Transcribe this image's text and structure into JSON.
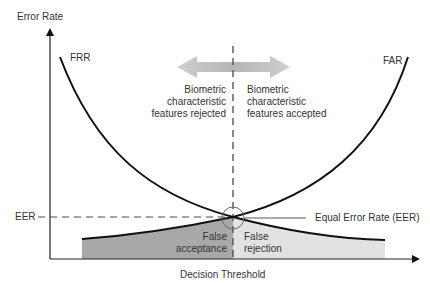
{
  "diagram": {
    "y_axis_label": "Error Rate",
    "x_axis_label": "Decision Threshold",
    "curve_frr_label": "FRR",
    "curve_far_label": "FAR",
    "eer_axis_label": "EER",
    "eer_callout": "Equal Error Rate (EER)",
    "rejected_text": [
      "Biometric",
      "characteristic",
      "features rejected"
    ],
    "accepted_text": [
      "Biometric",
      "characteristic",
      "features accepted"
    ],
    "false_acceptance": [
      "False",
      "acceptance"
    ],
    "false_rejection": [
      "False",
      "rejection"
    ],
    "colors": {
      "axis": "#222222",
      "curve": "#111111",
      "dash": "#888888",
      "false_acceptance_fill": "#a8a8a8",
      "false_rejection_fill": "#e2e2e2",
      "arrow_fill": "#bdbdbd",
      "text": "#333333"
    }
  }
}
